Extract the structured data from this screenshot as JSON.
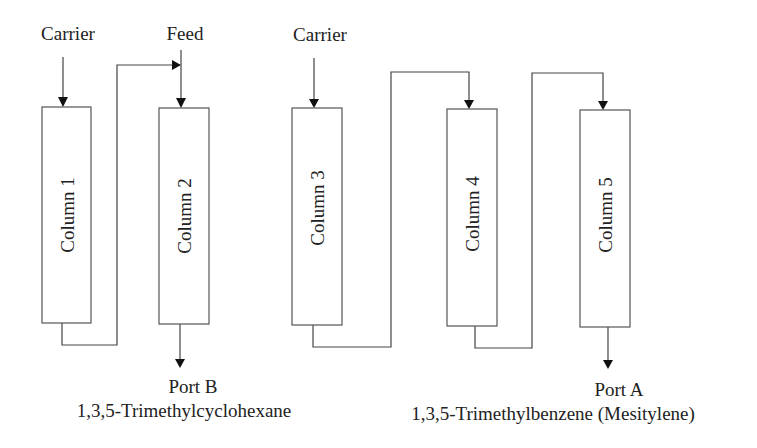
{
  "diagram": {
    "inputs": {
      "carrier_1": "Carrier",
      "feed": "Feed",
      "carrier_2": "Carrier"
    },
    "columns": [
      {
        "label": "Column 1"
      },
      {
        "label": "Column 2"
      },
      {
        "label": "Column 3"
      },
      {
        "label": "Column 4"
      },
      {
        "label": "Column 5"
      }
    ],
    "outputs": {
      "port_b": {
        "label": "Port B",
        "compound": "1,3,5-Trimethylcyclohexane"
      },
      "port_a": {
        "label": "Port A",
        "compound": "1,3,5-Trimethylbenzene (Mesitylene)"
      }
    },
    "connections": [
      {
        "from": "Carrier",
        "to": "Column 1"
      },
      {
        "from": "Column 1",
        "to": "Column 2"
      },
      {
        "from": "Feed",
        "to": "Column 2"
      },
      {
        "from": "Column 2",
        "to": "Port B"
      },
      {
        "from": "Carrier",
        "to": "Column 3"
      },
      {
        "from": "Column 3",
        "to": "Column 4"
      },
      {
        "from": "Column 4",
        "to": "Column 5"
      },
      {
        "from": "Column 5",
        "to": "Port A"
      }
    ]
  }
}
